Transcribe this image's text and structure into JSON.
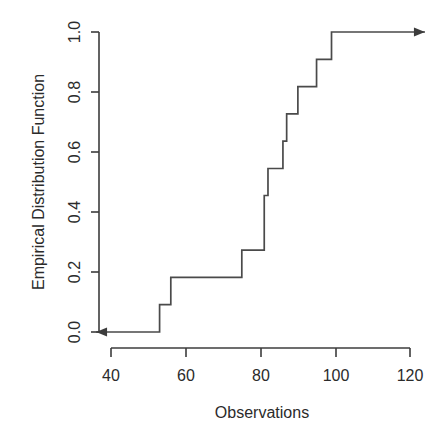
{
  "chart_data": {
    "type": "line",
    "subtype": "ecdf-step",
    "title": "",
    "xlabel": "Observations",
    "ylabel": "Empirical Distribution Function",
    "xlim": [
      36,
      124
    ],
    "ylim": [
      0.0,
      1.0
    ],
    "grid": false,
    "legend": null,
    "xticks": [
      40,
      60,
      80,
      100,
      120
    ],
    "xtick_labels": [
      "40",
      "60",
      "80",
      "100",
      "120"
    ],
    "yticks": [
      0.0,
      0.2,
      0.4,
      0.6,
      0.8,
      1.0
    ],
    "ytick_labels": [
      "0.0",
      "0.2",
      "0.4",
      "0.6",
      "0.8",
      "1.0"
    ],
    "n_observations": 11,
    "observations": [
      53,
      56,
      75,
      81,
      82,
      86,
      87,
      90,
      95,
      99,
      100
    ],
    "step_points": [
      {
        "x": 36,
        "y": 0.0
      },
      {
        "x": 53,
        "y": 0.0
      },
      {
        "x": 53,
        "y": 0.091
      },
      {
        "x": 56,
        "y": 0.091
      },
      {
        "x": 56,
        "y": 0.182
      },
      {
        "x": 75,
        "y": 0.182
      },
      {
        "x": 75,
        "y": 0.273
      },
      {
        "x": 81,
        "y": 0.273
      },
      {
        "x": 81,
        "y": 0.455
      },
      {
        "x": 82,
        "y": 0.455
      },
      {
        "x": 82,
        "y": 0.545
      },
      {
        "x": 86,
        "y": 0.545
      },
      {
        "x": 86,
        "y": 0.636
      },
      {
        "x": 87,
        "y": 0.636
      },
      {
        "x": 87,
        "y": 0.727
      },
      {
        "x": 90,
        "y": 0.727
      },
      {
        "x": 90,
        "y": 0.818
      },
      {
        "x": 95,
        "y": 0.818
      },
      {
        "x": 95,
        "y": 0.909
      },
      {
        "x": 99,
        "y": 0.909
      },
      {
        "x": 99,
        "y": 1.0
      },
      {
        "x": 124,
        "y": 1.0
      }
    ],
    "annotations": [
      {
        "name": "left-arrow",
        "description": "arrow pointing left at y = 0.0"
      },
      {
        "name": "right-arrow",
        "description": "arrow pointing right at y = 1.0"
      }
    ],
    "colors": {
      "line": "#4a4a4a",
      "axis": "#3c3c3c",
      "text": "#2b2b2b",
      "background": "#ffffff"
    }
  }
}
